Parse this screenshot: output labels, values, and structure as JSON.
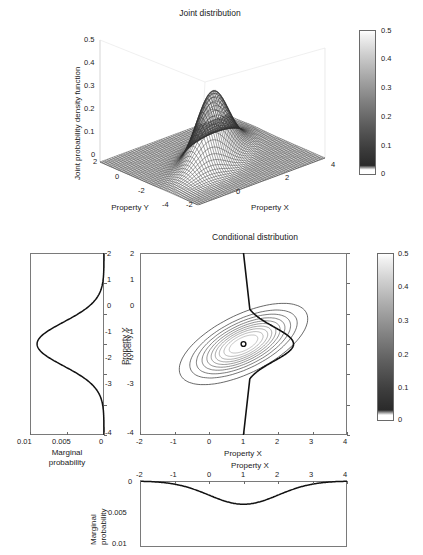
{
  "figure": {
    "panels": [
      "joint-3d-surface",
      "marginal-y",
      "conditional-contour",
      "marginal-x"
    ]
  },
  "joint": {
    "title": "Joint distribution",
    "zlabel": "Joint probability density function",
    "xlabel": "Property X",
    "ylabel": "Property Y",
    "zticks": [
      "0.5",
      "0.4",
      "0.3",
      "0.2",
      "0.1",
      "0"
    ],
    "xticks": [
      "-2",
      "0",
      "2",
      "4"
    ],
    "yticks": [
      "2",
      "0",
      "-2",
      "-4"
    ],
    "colorbar": {
      "ticks": [
        "0.5",
        "0.4",
        "0.3",
        "0.2",
        "0.1",
        "0"
      ],
      "min": 0,
      "max": 0.5,
      "colormap": "gray"
    }
  },
  "conditional": {
    "title": "Conditional distribution",
    "xlabel": "Property X",
    "ylabel": "Property Y",
    "xticks": [
      "-2",
      "-1",
      "0",
      "1",
      "2",
      "3",
      "4"
    ],
    "yticks": [
      "2",
      "1",
      "0",
      "-1",
      "-2",
      "-3",
      "-4"
    ],
    "colorbar": {
      "ticks": [
        "0.5",
        "0.4",
        "0.3",
        "0.2",
        "0.1",
        "0"
      ],
      "min": 0,
      "max": 0.5,
      "colormap": "gray"
    }
  },
  "marginal_y": {
    "xlabel_line1": "Marginal",
    "xlabel_line2": "probability",
    "ylabel": "Property Y",
    "xticks": [
      "0.01",
      "0.005",
      "0"
    ],
    "yticks": [
      "2",
      "1",
      "0",
      "-1",
      "-2",
      "-3",
      "-4"
    ]
  },
  "marginal_x": {
    "ylabel_line1": "Marginal",
    "ylabel_line2": "probability",
    "xlabel": "Property X",
    "xticks": [
      "-2",
      "-1",
      "0",
      "1",
      "2",
      "3",
      "4"
    ],
    "yticks": [
      "0",
      "0.005",
      "0.01"
    ]
  },
  "chart_data": [
    {
      "type": "surface",
      "title": "Joint distribution",
      "xlabel": "Property X",
      "ylabel": "Property Y",
      "zlabel": "Joint probability density function",
      "xlim": [
        -2,
        4
      ],
      "ylim": [
        -4,
        2
      ],
      "zlim": [
        0,
        0.5
      ],
      "peak": {
        "x": 1,
        "y": -1,
        "z": 0.44
      },
      "distribution": "bivariate normal",
      "mean": [
        1,
        -1
      ],
      "notes": "Dark grey mesh surface, single sharp Gaussian peak near (1,-1) reaching ~0.44",
      "colorbar": {
        "min": 0,
        "max": 0.5,
        "ticks": [
          0,
          0.1,
          0.2,
          0.3,
          0.4,
          0.5
        ]
      }
    },
    {
      "type": "line",
      "title": "Marginal probability of Property Y",
      "orientation": "vertical",
      "xlabel": "Marginal probability",
      "ylabel": "Property Y",
      "xlim": [
        0.0115,
        0
      ],
      "ylim": [
        -4,
        2
      ],
      "x_axis_reversed": true,
      "y": [
        2,
        1.5,
        1,
        0.5,
        0,
        -0.5,
        -1,
        -1.5,
        -2,
        -2.5,
        -3,
        -3.5,
        -4
      ],
      "values": [
        0.0002,
        0.0005,
        0.0012,
        0.003,
        0.0058,
        0.009,
        0.0104,
        0.009,
        0.0058,
        0.003,
        0.0012,
        0.0005,
        0.0002
      ],
      "peak": {
        "y": -1,
        "value": 0.0104
      }
    },
    {
      "type": "contour",
      "title": "Conditional distribution",
      "xlabel": "Property X",
      "ylabel": "Property Y",
      "xlim": [
        -2,
        4
      ],
      "ylim": [
        -4,
        2
      ],
      "center": [
        1,
        -1
      ],
      "ellipse_tilt_deg": -18,
      "n_contours": 10,
      "marker": {
        "x": 1,
        "y": -1,
        "shape": "circle"
      },
      "conditional_slice_x": 1,
      "notes": "Nested tilted ellipse contours centred at (1,-1); bold vertical line at x=1 with conditional density curve bulging rightwards around y=-1"
    },
    {
      "type": "line",
      "title": "Marginal probability of Property X",
      "orientation": "horizontal",
      "xlabel": "Property X",
      "ylabel": "Marginal probability",
      "xlim": [
        -2,
        4
      ],
      "ylim": [
        0.0105,
        0
      ],
      "y_axis_inverted": true,
      "x": [
        -2,
        -1.5,
        -1,
        -0.5,
        0,
        0.5,
        1,
        1.5,
        2,
        2.5,
        3,
        3.5,
        4
      ],
      "values": [
        0.0002,
        0.0004,
        0.0008,
        0.0016,
        0.0026,
        0.0034,
        0.0037,
        0.0034,
        0.0026,
        0.0016,
        0.0008,
        0.0004,
        0.0002
      ],
      "peak": {
        "x": 1,
        "value": 0.0037
      }
    }
  ]
}
